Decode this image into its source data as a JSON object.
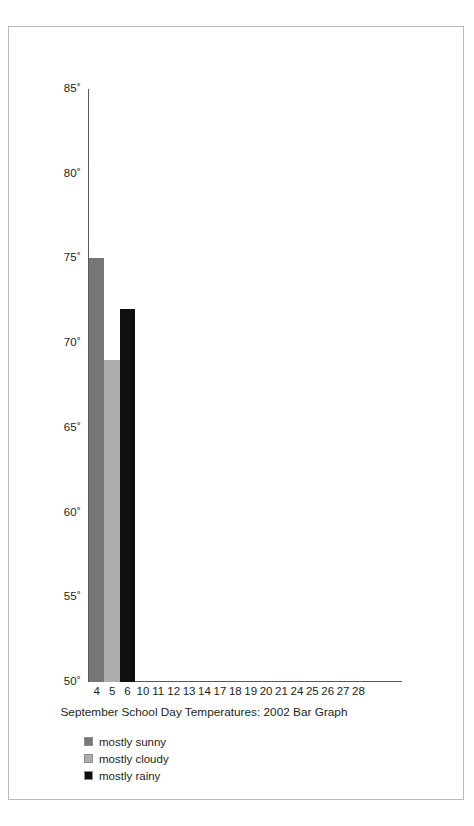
{
  "chart_data": {
    "type": "bar",
    "title": "September School Day Temperatures: 2002 Bar Graph",
    "xlabel": "",
    "ylabel": "",
    "ylim": [
      50,
      85
    ],
    "grid": false,
    "legend_position": "below-left",
    "y_ticks": [
      "85˚",
      "80˚",
      "75˚",
      "70˚",
      "65˚",
      "60˚",
      "55˚",
      "50˚"
    ],
    "y_tick_values": [
      85,
      80,
      75,
      70,
      65,
      60,
      55,
      50
    ],
    "categories": [
      "4",
      "5",
      "6",
      "10",
      "11",
      "12",
      "13",
      "14",
      "17",
      "18",
      "19",
      "20",
      "21",
      "24",
      "25",
      "26",
      "27",
      "28"
    ],
    "values": [
      75,
      69,
      72,
      null,
      null,
      null,
      null,
      null,
      null,
      null,
      null,
      null,
      null,
      null,
      null,
      null,
      null,
      null
    ],
    "bars": [
      {
        "category": "4",
        "value": 75,
        "condition": "mostly sunny",
        "color": "#767676"
      },
      {
        "category": "5",
        "value": 69,
        "condition": "mostly cloudy",
        "color": "#adadad"
      },
      {
        "category": "6",
        "value": 72,
        "condition": "mostly rainy",
        "color": "#0f0f0f"
      }
    ],
    "legend": [
      {
        "label": "mostly sunny",
        "color": "#767676"
      },
      {
        "label": "mostly cloudy",
        "color": "#adadad"
      },
      {
        "label": "mostly rainy",
        "color": "#0f0f0f"
      }
    ]
  },
  "axis": {
    "line_color": "#58595b"
  },
  "frame": {
    "border_color": "#b9b9b9"
  }
}
